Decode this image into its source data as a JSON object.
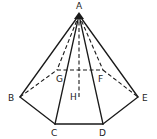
{
  "diagram": {
    "vertices": {
      "A": {
        "label": "A",
        "x": 79,
        "y": 15
      },
      "B": {
        "label": "B",
        "x": 20,
        "y": 97
      },
      "C": {
        "label": "C",
        "x": 55,
        "y": 124
      },
      "D": {
        "label": "D",
        "x": 103,
        "y": 124
      },
      "E": {
        "label": "E",
        "x": 138,
        "y": 97
      },
      "F": {
        "label": "F",
        "x": 103,
        "y": 70
      },
      "G": {
        "label": "G",
        "x": 57,
        "y": 70
      },
      "H": {
        "label": "H",
        "x": 79,
        "y": 96
      }
    },
    "solid_edges": [
      [
        "A",
        "B"
      ],
      [
        "A",
        "C"
      ],
      [
        "A",
        "D"
      ],
      [
        "A",
        "E"
      ],
      [
        "B",
        "C"
      ],
      [
        "C",
        "D"
      ],
      [
        "D",
        "E"
      ]
    ],
    "dashed_edges": [
      [
        "A",
        "G"
      ],
      [
        "A",
        "F"
      ],
      [
        "A",
        "H"
      ],
      [
        "B",
        "G"
      ],
      [
        "G",
        "F"
      ],
      [
        "F",
        "E"
      ]
    ],
    "labels": {
      "A": "A",
      "B": "B",
      "C": "C",
      "D": "D",
      "E": "E",
      "F": "F",
      "G": "G",
      "H": "H"
    }
  }
}
